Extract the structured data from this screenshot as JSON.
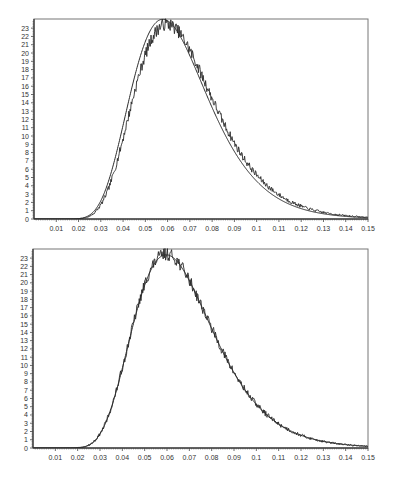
{
  "chart_data": [
    {
      "type": "line",
      "title": "",
      "xlabel": "",
      "ylabel": "",
      "xlim": [
        0,
        0.15
      ],
      "ylim": [
        0,
        24.1
      ],
      "grid": false,
      "legend": null,
      "x_ticks": [
        "0.01",
        "0.02",
        "0.03",
        "0.04",
        "0.05",
        "0.06",
        "0.07",
        "0.08",
        "0.09",
        "0.1",
        "0.11",
        "0.12",
        "0.13",
        "0.14",
        "0.15"
      ],
      "y_ticks": [
        "0",
        "1",
        "2",
        "3",
        "4",
        "5",
        "6",
        "7",
        "8",
        "9",
        "10",
        "11",
        "12",
        "13",
        "14",
        "15",
        "16",
        "17",
        "18",
        "19",
        "20",
        "21",
        "22",
        "23"
      ],
      "x": [
        0.02,
        0.025,
        0.03,
        0.035,
        0.04,
        0.045,
        0.05,
        0.055,
        0.06,
        0.065,
        0.07,
        0.075,
        0.08,
        0.085,
        0.09,
        0.095,
        0.1,
        0.11,
        0.12,
        0.13,
        0.14,
        0.15
      ],
      "series": [
        {
          "name": "fitted density (smooth)",
          "values": [
            0,
            0.3,
            1.5,
            5,
            10.5,
            16.5,
            21.5,
            23.8,
            23.2,
            21,
            17.8,
            14.5,
            11.3,
            8.6,
            6.4,
            4.7,
            3.4,
            1.7,
            0.85,
            0.4,
            0.2,
            0.1
          ]
        },
        {
          "name": "empirical density (noisy)",
          "values": [
            0,
            0.2,
            1.1,
            4,
            9.2,
            15,
            20.2,
            23,
            23.4,
            21.8,
            18.8,
            15.6,
            12.4,
            9.6,
            7.2,
            5.3,
            3.9,
            2,
            1,
            0.5,
            0.25,
            0.1
          ]
        }
      ]
    },
    {
      "type": "line",
      "title": "",
      "xlabel": "",
      "ylabel": "",
      "xlim": [
        0,
        0.15
      ],
      "ylim": [
        0,
        24.1
      ],
      "grid": false,
      "legend": null,
      "x_ticks": [
        "0.01",
        "0.02",
        "0.03",
        "0.04",
        "0.05",
        "0.06",
        "0.07",
        "0.08",
        "0.09",
        "0.1",
        "0.11",
        "0.12",
        "0.13",
        "0.14",
        "0.15"
      ],
      "y_ticks": [
        "0",
        "1",
        "2",
        "3",
        "4",
        "5",
        "6",
        "7",
        "8",
        "9",
        "10",
        "11",
        "12",
        "13",
        "14",
        "15",
        "16",
        "17",
        "18",
        "19",
        "20",
        "21",
        "22",
        "23"
      ],
      "x": [
        0.02,
        0.025,
        0.03,
        0.035,
        0.04,
        0.045,
        0.05,
        0.055,
        0.06,
        0.065,
        0.07,
        0.075,
        0.08,
        0.085,
        0.09,
        0.095,
        0.1,
        0.11,
        0.12,
        0.13,
        0.14,
        0.15
      ],
      "series": [
        {
          "name": "fitted density (smooth)",
          "values": [
            0,
            0.2,
            1.1,
            4,
            9.2,
            15,
            20.2,
            23,
            23.4,
            21.8,
            18.8,
            15.6,
            12.4,
            9.6,
            7.2,
            5.3,
            3.9,
            2,
            1,
            0.5,
            0.25,
            0.1
          ]
        },
        {
          "name": "empirical density (noisy)",
          "values": [
            0,
            0.2,
            1.1,
            4,
            9.2,
            15,
            20.2,
            23,
            23.4,
            21.8,
            18.8,
            15.6,
            12.4,
            9.6,
            7.2,
            5.3,
            3.9,
            2,
            1,
            0.5,
            0.25,
            0.1
          ]
        }
      ]
    }
  ],
  "charts": [
    {
      "id": "top",
      "top": 0,
      "plot": {
        "left": 34,
        "top": 19,
        "right": 368,
        "bottom": 219
      },
      "smooth": {
        "mu": -2.76,
        "sigma": 0.3,
        "scale": 23.8,
        "peak": 0.0553
      },
      "noisy": {
        "mu": -2.73,
        "sigma": 0.3,
        "scale": 23.4,
        "peak": 0.058,
        "noise": 0.35,
        "seed": 7
      }
    },
    {
      "id": "bottom",
      "top": 230,
      "plot": {
        "left": 33,
        "top": 19,
        "right": 368,
        "bottom": 218
      },
      "smooth": {
        "mu": -2.73,
        "sigma": 0.3,
        "scale": 23.3,
        "peak": 0.058
      },
      "noisy": {
        "mu": -2.73,
        "sigma": 0.3,
        "scale": 23.4,
        "peak": 0.058,
        "noise": 0.35,
        "seed": 13
      }
    }
  ],
  "axis": {
    "x_min": 0,
    "x_max": 0.15,
    "y_max": 24.1,
    "x_tick_labels": [
      "0.01",
      "0.02",
      "0.03",
      "0.04",
      "0.05",
      "0.06",
      "0.07",
      "0.08",
      "0.09",
      "0.1",
      "0.11",
      "0.12",
      "0.13",
      "0.14",
      "0.15"
    ],
    "y_tick_labels": [
      "0",
      "1",
      "2",
      "3",
      "4",
      "5",
      "6",
      "7",
      "8",
      "9",
      "10",
      "11",
      "12",
      "13",
      "14",
      "15",
      "16",
      "17",
      "18",
      "19",
      "20",
      "21",
      "22",
      "23"
    ]
  },
  "colors": {
    "line": "#2a2a2a",
    "axis": "#444444",
    "frame": "#777777",
    "text": "#333333"
  }
}
